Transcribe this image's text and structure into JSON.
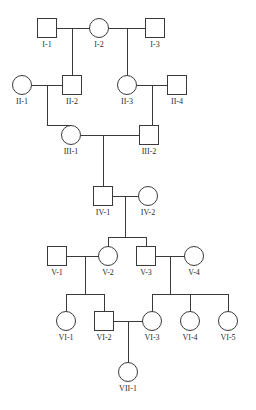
{
  "figure": {
    "kind": "pedigree-chart",
    "background_color": "#ffffff",
    "line_color": "#3a3a3a",
    "symbol_fill": "#ffffff",
    "label_color": "#2b2b2b",
    "symbol_size": 19,
    "canvas": {
      "width": 256,
      "height": 410
    }
  },
  "legend_shapes": {
    "square": "male",
    "circle": "female"
  },
  "generations": [
    {
      "roman": "I",
      "y": 28,
      "label_y": 40
    },
    {
      "roman": "II",
      "y": 85,
      "label_y": 97
    },
    {
      "roman": "III",
      "y": 135,
      "label_y": 147
    },
    {
      "roman": "IV",
      "y": 196,
      "label_y": 208
    },
    {
      "roman": "V",
      "y": 256,
      "label_y": 268
    },
    {
      "roman": "VI",
      "y": 321,
      "label_y": 333
    },
    {
      "roman": "VII",
      "y": 372,
      "label_y": 384
    }
  ],
  "individuals": [
    {
      "id": "I-1",
      "label": "I-1",
      "sex": "male",
      "shape": "square",
      "x": 47,
      "y": 28,
      "generation": "I"
    },
    {
      "id": "I-2",
      "label": "I-2",
      "sex": "female",
      "shape": "circle",
      "x": 99,
      "y": 28,
      "generation": "I"
    },
    {
      "id": "I-3",
      "label": "I-3",
      "sex": "male",
      "shape": "square",
      "x": 155,
      "y": 28,
      "generation": "I"
    },
    {
      "id": "II-1",
      "label": "II-1",
      "sex": "female",
      "shape": "circle",
      "x": 22,
      "y": 85,
      "generation": "II"
    },
    {
      "id": "II-2",
      "label": "II-2",
      "sex": "male",
      "shape": "square",
      "x": 72,
      "y": 85,
      "generation": "II"
    },
    {
      "id": "II-3",
      "label": "II-3",
      "sex": "female",
      "shape": "circle",
      "x": 127,
      "y": 85,
      "generation": "II"
    },
    {
      "id": "II-4",
      "label": "II-4",
      "sex": "male",
      "shape": "square",
      "x": 177,
      "y": 85,
      "generation": "II"
    },
    {
      "id": "III-1",
      "label": "III-1",
      "sex": "female",
      "shape": "circle",
      "x": 71,
      "y": 135,
      "generation": "III"
    },
    {
      "id": "III-2",
      "label": "III-2",
      "sex": "male",
      "shape": "square",
      "x": 149,
      "y": 135,
      "generation": "III"
    },
    {
      "id": "IV-1",
      "label": "IV-1",
      "sex": "male",
      "shape": "square",
      "x": 103,
      "y": 196,
      "generation": "IV"
    },
    {
      "id": "IV-2",
      "label": "IV-2",
      "sex": "female",
      "shape": "circle",
      "x": 148,
      "y": 196,
      "generation": "IV"
    },
    {
      "id": "V-1",
      "label": "V-1",
      "sex": "male",
      "shape": "square",
      "x": 57,
      "y": 256,
      "generation": "V"
    },
    {
      "id": "V-2",
      "label": "V-2",
      "sex": "female",
      "shape": "circle",
      "x": 108,
      "y": 256,
      "generation": "V"
    },
    {
      "id": "V-3",
      "label": "V-3",
      "sex": "male",
      "shape": "square",
      "x": 146,
      "y": 256,
      "generation": "V"
    },
    {
      "id": "V-4",
      "label": "V-4",
      "sex": "female",
      "shape": "circle",
      "x": 194,
      "y": 256,
      "generation": "V"
    },
    {
      "id": "VI-1",
      "label": "VI-1",
      "sex": "female",
      "shape": "circle",
      "x": 66,
      "y": 321,
      "generation": "VI"
    },
    {
      "id": "VI-2",
      "label": "VI-2",
      "sex": "male",
      "shape": "square",
      "x": 104,
      "y": 321,
      "generation": "VI"
    },
    {
      "id": "VI-3",
      "label": "VI-3",
      "sex": "female",
      "shape": "circle",
      "x": 152,
      "y": 321,
      "generation": "VI"
    },
    {
      "id": "VI-4",
      "label": "VI-4",
      "sex": "female",
      "shape": "circle",
      "x": 190,
      "y": 321,
      "generation": "VI"
    },
    {
      "id": "VI-5",
      "label": "VI-5",
      "sex": "female",
      "shape": "circle",
      "x": 228,
      "y": 321,
      "generation": "VI"
    },
    {
      "id": "VII-1",
      "label": "VII-1",
      "sex": "female",
      "shape": "circle",
      "x": 128,
      "y": 372,
      "generation": "VII"
    }
  ],
  "matings": [
    {
      "id": "m1",
      "partners": [
        "I-1",
        "I-2"
      ],
      "line_y": 28,
      "drop_x": 72,
      "children": [
        "II-2"
      ]
    },
    {
      "id": "m2",
      "partners": [
        "I-2",
        "I-3"
      ],
      "line_y": 28,
      "drop_x": 127,
      "children": [
        "II-3"
      ]
    },
    {
      "id": "m3",
      "partners": [
        "II-1",
        "II-2"
      ],
      "line_y": 85,
      "drop_x": 47,
      "children": [
        "III-1"
      ]
    },
    {
      "id": "m4",
      "partners": [
        "II-3",
        "II-4"
      ],
      "line_y": 85,
      "drop_x": 152,
      "children": [
        "III-2"
      ]
    },
    {
      "id": "m5",
      "partners": [
        "III-1",
        "III-2"
      ],
      "line_y": 135,
      "drop_x": 103,
      "children": [
        "IV-1"
      ]
    },
    {
      "id": "m6",
      "partners": [
        "IV-1",
        "IV-2"
      ],
      "line_y": 196,
      "drop_x": 125,
      "children": [
        "V-2",
        "V-3"
      ]
    },
    {
      "id": "m7",
      "partners": [
        "V-1",
        "V-2"
      ],
      "line_y": 256,
      "drop_x": 85,
      "children": [
        "VI-1",
        "VI-2"
      ]
    },
    {
      "id": "m8",
      "partners": [
        "V-3",
        "V-4"
      ],
      "line_y": 256,
      "drop_x": 170,
      "children": [
        "VI-3",
        "VI-4",
        "VI-5"
      ]
    },
    {
      "id": "m9",
      "partners": [
        "VI-2",
        "VI-3"
      ],
      "line_y": 321,
      "drop_x": 128,
      "children": [
        "VII-1"
      ]
    }
  ],
  "sibship_bars": [
    {
      "mating": "m6",
      "y": 237,
      "x1": 108,
      "x2": 146
    },
    {
      "mating": "m7",
      "y": 294,
      "x1": 66,
      "x2": 104
    },
    {
      "mating": "m8",
      "y": 294,
      "x1": 152,
      "x2": 228
    }
  ],
  "descent_segments": [
    {
      "mating": "m1",
      "from_y": 28,
      "to_y": 75
    },
    {
      "mating": "m2",
      "from_y": 28,
      "to_y": 75
    },
    {
      "mating": "m3",
      "from_y": 85,
      "to_y": 125
    },
    {
      "mating": "m4",
      "from_y": 85,
      "to_y": 125
    },
    {
      "mating": "m5",
      "from_y": 135,
      "to_y": 186
    },
    {
      "mating": "m6",
      "from_y": 196,
      "to_y": 237
    },
    {
      "mating": "m7",
      "from_y": 256,
      "to_y": 294
    },
    {
      "mating": "m8",
      "from_y": 256,
      "to_y": 294
    },
    {
      "mating": "m9",
      "from_y": 321,
      "to_y": 362
    }
  ]
}
